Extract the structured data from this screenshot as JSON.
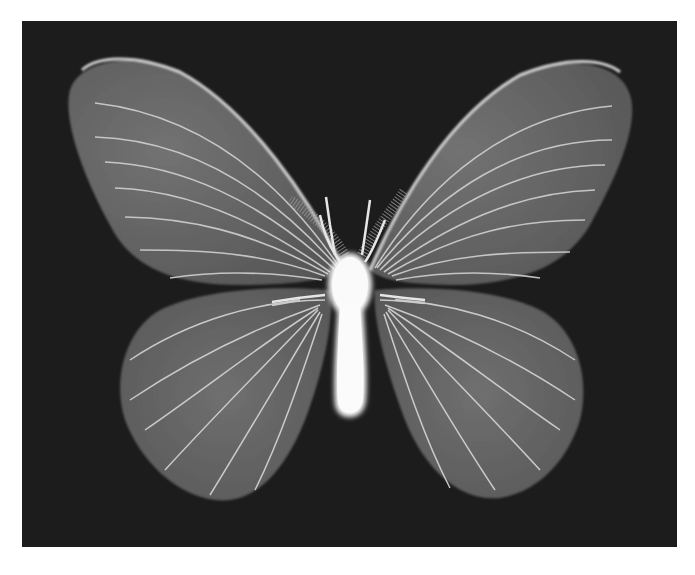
{
  "image": {
    "subject": "X-ray radiograph of a moth with wings spread",
    "background_color": "#1c1c1c",
    "page_color": "#ffffff",
    "wing_color": "#6e6e6e",
    "vein_color": "#d8d8d8",
    "body_color": "#f4f4f4"
  }
}
